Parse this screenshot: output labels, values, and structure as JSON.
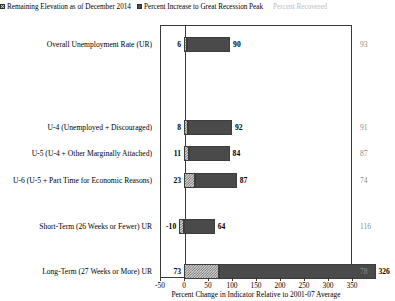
{
  "legend": {
    "items": [
      {
        "label": "Remaining Elevation as of December 2014",
        "marker": "hatched-square-icon",
        "style": "hatch",
        "color": "#cfcfcf"
      },
      {
        "label": "Percent Increase to Great Recession Peak",
        "marker": "filled-square-icon",
        "style": "solid",
        "color": "#4b4b4b"
      },
      {
        "label": "Percent Recovered",
        "marker": "none",
        "style": "text",
        "color": "#bdbdbd"
      }
    ]
  },
  "chart_data": {
    "type": "bar",
    "orientation": "horizontal",
    "stacked": true,
    "title": "",
    "xlabel": "Percent Change in Indicator Relative to 2001-07 Average",
    "ylabel": "",
    "xlim": [
      -50,
      350
    ],
    "xticks": [
      -50,
      0,
      50,
      100,
      150,
      200,
      250,
      300,
      350
    ],
    "xticklabels": [
      "-50",
      "0",
      "50",
      "100",
      "150",
      "200",
      "250",
      "300",
      "350"
    ],
    "grid": false,
    "legend_position": "top",
    "categories": [
      "Overall Unemployment Rate (UR)",
      "U-4 (Unemployed + Discouraged)",
      "U-5 (U-4 + Other Marginally Attached)",
      "U-6 (U-5 + Part Time for Economic Reasons)",
      "Short-Term (26 Weeks or Fewer) UR",
      "Long-Term (27 Weeks or More) UR"
    ],
    "series": [
      {
        "name": "Remaining Elevation as of December 2014",
        "values": [
          6,
          8,
          11,
          23,
          -10,
          73
        ]
      },
      {
        "name": "Percent Increase to Great Recession Peak",
        "values": [
          90,
          92,
          84,
          87,
          64,
          326
        ]
      }
    ],
    "annotations": {
      "name": "Percent Recovered",
      "values": [
        93,
        91,
        87,
        74,
        116,
        78
      ]
    },
    "row_y_centers": [
      45,
      128,
      154,
      181,
      227,
      272
    ]
  },
  "rows": [
    {
      "category": "Overall Unemployment Rate (UR)",
      "remaining": 6,
      "remaining_label": "6",
      "increase": 90,
      "increase_label": "90",
      "recovered_label": "93",
      "top": 21
    },
    {
      "category": "U-4 (Unemployed + Discouraged)",
      "remaining": 8,
      "remaining_label": "8",
      "increase": 92,
      "increase_label": "92",
      "recovered_label": "91",
      "top": 104
    },
    {
      "category": "U-5 (U-4 + Other Marginally Attached)",
      "remaining": 11,
      "remaining_label": "11",
      "increase": 84,
      "increase_label": "84",
      "recovered_label": "87",
      "top": 130
    },
    {
      "category": "U-6 (U-5 + Part Time for Economic Reasons)",
      "remaining": 23,
      "remaining_label": "23",
      "increase": 87,
      "increase_label": "87",
      "recovered_label": "74",
      "top": 157
    },
    {
      "category": "Short-Term (26 Weeks or Fewer) UR",
      "remaining": -10,
      "remaining_label": "-10",
      "increase": 64,
      "increase_label": "64",
      "recovered_label": "116",
      "top": 203
    },
    {
      "category": "Long-Term (27 Weeks or More) UR",
      "remaining": 73,
      "remaining_label": "73",
      "increase": 326,
      "increase_label": "326",
      "recovered_label": "78",
      "top": 248
    }
  ],
  "axis": {
    "title": "Percent Change in Indicator Relative to 2001-07 Average",
    "ticks": [
      "-50",
      "0",
      "50",
      "100",
      "150",
      "200",
      "250",
      "300",
      "350"
    ]
  }
}
